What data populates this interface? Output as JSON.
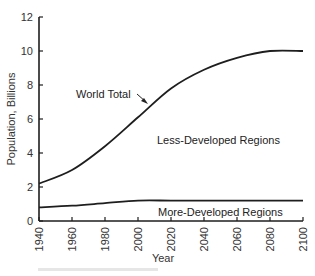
{
  "chart_data": {
    "type": "line",
    "title": "",
    "xlabel": "Year",
    "ylabel": "Population, Billions",
    "xlim": [
      1940,
      2100
    ],
    "ylim": [
      0,
      12
    ],
    "x_ticks": [
      1940,
      1960,
      1980,
      2000,
      2020,
      2040,
      2060,
      2080,
      2100
    ],
    "y_ticks": [
      0,
      2,
      4,
      6,
      8,
      10,
      12
    ],
    "grid": false,
    "x": [
      1940,
      1960,
      1980,
      2000,
      2020,
      2040,
      2060,
      2080,
      2100
    ],
    "series": [
      {
        "name": "World Total",
        "values": [
          2.2,
          3.0,
          4.4,
          6.1,
          7.8,
          8.9,
          9.6,
          10.0,
          10.0
        ]
      },
      {
        "name": "More-Developed Regions",
        "values": [
          0.8,
          0.9,
          1.05,
          1.2,
          1.2,
          1.2,
          1.2,
          1.2,
          1.2
        ]
      }
    ],
    "annotations": [
      {
        "text": "World Total",
        "type": "arrow-label",
        "points_to_year": 2000
      },
      {
        "text": "Less-Developed Regions",
        "type": "region-label"
      },
      {
        "text": "More-Developed Regions",
        "type": "region-label"
      }
    ],
    "legend": "none (inline labels)"
  },
  "labels": {
    "ylabel": "Population, Billions",
    "xlabel": "Year",
    "world_total": "World Total",
    "less_developed": "Less-Developed Regions",
    "more_developed": "More-Developed Regions"
  },
  "colors": {
    "line": "#1e1e1e",
    "text": "#333333",
    "background": "#ffffff"
  }
}
